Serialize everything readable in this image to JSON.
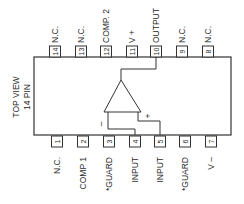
{
  "title": {
    "line1": "TOP VIEW",
    "line2": "14 PIN"
  },
  "body": {
    "x": 34,
    "y": 57,
    "width": 197,
    "height": 78
  },
  "top_pins": [
    {
      "number": "14",
      "label": "N.C.",
      "x": 55
    },
    {
      "number": "13",
      "label": "N.C.",
      "x": 81
    },
    {
      "number": "12",
      "label": "COMP. 2",
      "x": 106
    },
    {
      "number": "11",
      "label": "V +",
      "x": 132
    },
    {
      "number": "10",
      "label": "OUTPUT",
      "x": 156
    },
    {
      "number": "9",
      "label": "N.C.",
      "x": 182
    },
    {
      "number": "8",
      "label": "N.C.",
      "x": 208
    }
  ],
  "bottom_pins": [
    {
      "number": "1",
      "label": "N.C.",
      "x": 57
    },
    {
      "number": "2",
      "label": "COMP 1",
      "x": 83
    },
    {
      "number": "3",
      "label": "*GUARD",
      "x": 109
    },
    {
      "number": "4",
      "label": "INPUT",
      "x": 135
    },
    {
      "number": "5",
      "label": "INPUT",
      "x": 160
    },
    {
      "number": "6",
      "label": "*GUARD",
      "x": 185
    },
    {
      "number": "7",
      "label": "V –",
      "x": 211
    }
  ],
  "opamp": {
    "inverting_symbol": "–",
    "noninverting_symbol": "+"
  },
  "colors": {
    "line": "#333333",
    "background": "#ffffff"
  }
}
